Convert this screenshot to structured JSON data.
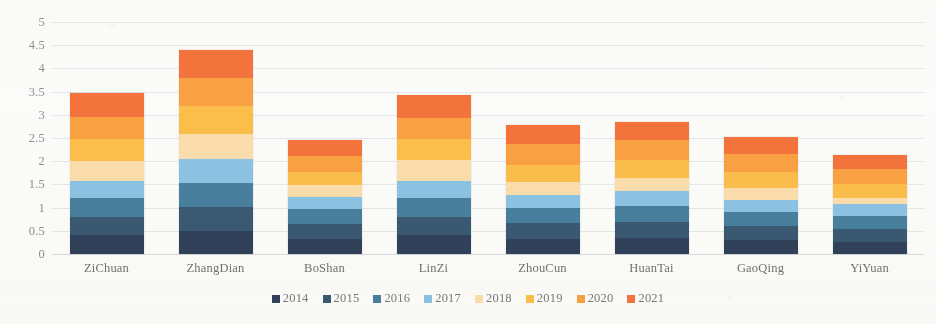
{
  "chart_data": {
    "type": "bar",
    "stacked": true,
    "title": "",
    "xlabel": "",
    "ylabel": "",
    "ylim": [
      0,
      5
    ],
    "ytick_step": 0.5,
    "ytick_labels": [
      "5",
      "4.5",
      "4",
      "3.5",
      "3",
      "2.5",
      "2",
      "1.5",
      "1",
      "0.5",
      "0"
    ],
    "grid": true,
    "legend_position": "bottom",
    "categories": [
      "ZiChuan",
      "ZhangDian",
      "BoShan",
      "LinZi",
      "ZhouCun",
      "HuanTai",
      "GaoQing",
      "YiYuan"
    ],
    "series": [
      {
        "name": "2014",
        "color": "#31415a",
        "values": [
          0.4,
          0.5,
          0.33,
          0.4,
          0.33,
          0.35,
          0.31,
          0.26
        ]
      },
      {
        "name": "2015",
        "color": "#3a5972",
        "values": [
          0.4,
          0.52,
          0.32,
          0.4,
          0.33,
          0.34,
          0.3,
          0.27
        ]
      },
      {
        "name": "2016",
        "color": "#477f9e",
        "values": [
          0.4,
          0.52,
          0.31,
          0.4,
          0.33,
          0.34,
          0.3,
          0.28
        ]
      },
      {
        "name": "2017",
        "color": "#8cc2e3",
        "values": [
          0.37,
          0.5,
          0.26,
          0.38,
          0.28,
          0.32,
          0.26,
          0.27
        ]
      },
      {
        "name": "2018",
        "color": "#fbddad",
        "values": [
          0.44,
          0.55,
          0.26,
          0.44,
          0.28,
          0.29,
          0.26,
          0.12
        ]
      },
      {
        "name": "2019",
        "color": "#fbbe4b",
        "values": [
          0.47,
          0.6,
          0.29,
          0.45,
          0.38,
          0.38,
          0.33,
          0.3
        ]
      },
      {
        "name": "2020",
        "color": "#f9a142",
        "values": [
          0.48,
          0.61,
          0.34,
          0.46,
          0.45,
          0.44,
          0.39,
          0.33
        ]
      },
      {
        "name": "2021",
        "color": "#f4733c",
        "values": [
          0.51,
          0.6,
          0.34,
          0.49,
          0.4,
          0.39,
          0.38,
          0.3
        ]
      }
    ],
    "totals": [
      3.47,
      4.4,
      2.45,
      3.42,
      2.78,
      2.85,
      2.53,
      2.13
    ]
  },
  "axis": {
    "color": "#8d8f91"
  }
}
